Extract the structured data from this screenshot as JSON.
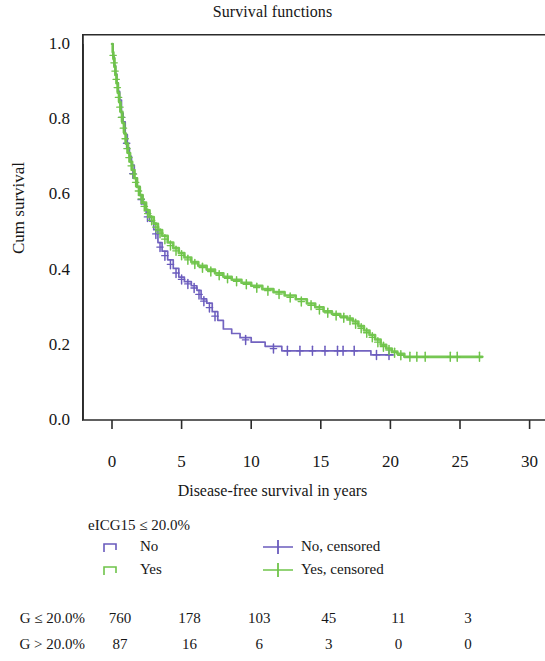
{
  "chart_data": {
    "type": "line",
    "title": "Survival functions",
    "xlabel": "Disease-free survival in years",
    "ylabel": "Cum survival",
    "xlim": [
      -1.2,
      31.5
    ],
    "ylim": [
      0.0,
      1.04
    ],
    "xticks": [
      0,
      5,
      10,
      15,
      20,
      25,
      30
    ],
    "xtick_labels": [
      "0",
      "5",
      "10",
      "15",
      "20",
      "25",
      "30"
    ],
    "yticks": [
      0.0,
      0.2,
      0.4,
      0.6,
      0.8,
      1.0
    ],
    "ytick_labels": [
      "0.0",
      "0.2",
      "0.4",
      "0.6",
      "0.8",
      "1.0"
    ],
    "grid": false,
    "legend_position": "below-axes",
    "colors": {
      "no": "#6a5bbd",
      "yes": "#6fc44a",
      "axis": "#2b2b2b",
      "text": "#161616"
    },
    "series": [
      {
        "name": "No",
        "group": "eICG15 > 20.0%",
        "color": "#6a5bbd",
        "step": "post",
        "points": [
          [
            0.0,
            1.0
          ],
          [
            0.08,
            0.966
          ],
          [
            0.16,
            0.943
          ],
          [
            0.25,
            0.92
          ],
          [
            0.35,
            0.897
          ],
          [
            0.45,
            0.874
          ],
          [
            0.55,
            0.851
          ],
          [
            0.68,
            0.816
          ],
          [
            0.8,
            0.793
          ],
          [
            0.95,
            0.759
          ],
          [
            1.1,
            0.724
          ],
          [
            1.25,
            0.701
          ],
          [
            1.4,
            0.678
          ],
          [
            1.6,
            0.644
          ],
          [
            1.8,
            0.621
          ],
          [
            2.0,
            0.598
          ],
          [
            2.2,
            0.575
          ],
          [
            2.45,
            0.552
          ],
          [
            2.7,
            0.529
          ],
          [
            3.0,
            0.506
          ],
          [
            3.3,
            0.472
          ],
          [
            3.6,
            0.449
          ],
          [
            4.0,
            0.426
          ],
          [
            4.4,
            0.403
          ],
          [
            4.8,
            0.38
          ],
          [
            5.2,
            0.368
          ],
          [
            5.7,
            0.357
          ],
          [
            6.1,
            0.345
          ],
          [
            6.4,
            0.322
          ],
          [
            6.8,
            0.311
          ],
          [
            7.2,
            0.288
          ],
          [
            7.6,
            0.265
          ],
          [
            8.0,
            0.242
          ],
          [
            8.6,
            0.23
          ],
          [
            9.2,
            0.219
          ],
          [
            10.0,
            0.207
          ],
          [
            11.0,
            0.196
          ],
          [
            12.2,
            0.184
          ],
          [
            13.0,
            0.184
          ],
          [
            14.0,
            0.184
          ],
          [
            15.0,
            0.184
          ],
          [
            16.0,
            0.184
          ],
          [
            17.0,
            0.184
          ],
          [
            17.8,
            0.184
          ],
          [
            18.6,
            0.173
          ],
          [
            19.4,
            0.173
          ],
          [
            20.2,
            0.173
          ]
        ],
        "censored": [
          [
            0.7,
            0.805
          ],
          [
            1.05,
            0.736
          ],
          [
            1.5,
            0.655
          ],
          [
            2.1,
            0.586
          ],
          [
            2.55,
            0.54
          ],
          [
            3.15,
            0.495
          ],
          [
            3.45,
            0.46
          ],
          [
            3.8,
            0.437
          ],
          [
            4.2,
            0.414
          ],
          [
            4.6,
            0.391
          ],
          [
            5.0,
            0.374
          ],
          [
            5.45,
            0.362
          ],
          [
            5.9,
            0.351
          ],
          [
            6.25,
            0.334
          ],
          [
            6.6,
            0.316
          ],
          [
            7.0,
            0.299
          ],
          [
            7.4,
            0.276
          ],
          [
            9.6,
            0.213
          ],
          [
            11.6,
            0.19
          ],
          [
            12.6,
            0.184
          ],
          [
            13.5,
            0.184
          ],
          [
            14.4,
            0.184
          ],
          [
            15.3,
            0.184
          ],
          [
            16.2,
            0.184
          ],
          [
            16.6,
            0.184
          ],
          [
            17.4,
            0.184
          ],
          [
            19.0,
            0.173
          ],
          [
            19.9,
            0.173
          ]
        ]
      },
      {
        "name": "Yes",
        "group": "eICG15 ≤ 20.0%",
        "color": "#6fc44a",
        "step": "post",
        "points": [
          [
            0.0,
            1.0
          ],
          [
            0.05,
            0.978
          ],
          [
            0.1,
            0.962
          ],
          [
            0.18,
            0.94
          ],
          [
            0.25,
            0.918
          ],
          [
            0.33,
            0.896
          ],
          [
            0.42,
            0.87
          ],
          [
            0.52,
            0.845
          ],
          [
            0.62,
            0.82
          ],
          [
            0.75,
            0.79
          ],
          [
            0.88,
            0.762
          ],
          [
            1.0,
            0.735
          ],
          [
            1.15,
            0.71
          ],
          [
            1.3,
            0.687
          ],
          [
            1.45,
            0.665
          ],
          [
            1.62,
            0.643
          ],
          [
            1.8,
            0.62
          ],
          [
            2.0,
            0.598
          ],
          [
            2.2,
            0.578
          ],
          [
            2.45,
            0.558
          ],
          [
            2.7,
            0.54
          ],
          [
            3.0,
            0.522
          ],
          [
            3.3,
            0.505
          ],
          [
            3.6,
            0.49
          ],
          [
            4.0,
            0.472
          ],
          [
            4.4,
            0.457
          ],
          [
            4.8,
            0.444
          ],
          [
            5.2,
            0.432
          ],
          [
            5.7,
            0.42
          ],
          [
            6.2,
            0.41
          ],
          [
            6.8,
            0.4
          ],
          [
            7.4,
            0.39
          ],
          [
            8.0,
            0.381
          ],
          [
            8.6,
            0.373
          ],
          [
            9.3,
            0.365
          ],
          [
            10.0,
            0.357
          ],
          [
            10.8,
            0.348
          ],
          [
            11.6,
            0.34
          ],
          [
            12.4,
            0.331
          ],
          [
            13.2,
            0.321
          ],
          [
            14.0,
            0.31
          ],
          [
            14.6,
            0.3
          ],
          [
            15.2,
            0.289
          ],
          [
            15.8,
            0.282
          ],
          [
            16.4,
            0.275
          ],
          [
            16.9,
            0.27
          ],
          [
            17.3,
            0.262
          ],
          [
            17.7,
            0.25
          ],
          [
            18.1,
            0.238
          ],
          [
            18.5,
            0.226
          ],
          [
            18.9,
            0.214
          ],
          [
            19.3,
            0.2
          ],
          [
            19.7,
            0.19
          ],
          [
            20.1,
            0.182
          ],
          [
            20.5,
            0.176
          ],
          [
            21.0,
            0.168
          ],
          [
            22.0,
            0.168
          ],
          [
            23.0,
            0.168
          ],
          [
            24.0,
            0.168
          ],
          [
            25.0,
            0.168
          ],
          [
            26.0,
            0.168
          ],
          [
            26.6,
            0.168
          ]
        ],
        "censored": [
          [
            0.08,
            0.97
          ],
          [
            0.15,
            0.95
          ],
          [
            0.22,
            0.928
          ],
          [
            0.3,
            0.906
          ],
          [
            0.38,
            0.884
          ],
          [
            0.47,
            0.858
          ],
          [
            0.57,
            0.832
          ],
          [
            0.68,
            0.805
          ],
          [
            0.82,
            0.776
          ],
          [
            0.95,
            0.748
          ],
          [
            1.08,
            0.722
          ],
          [
            1.22,
            0.698
          ],
          [
            1.38,
            0.676
          ],
          [
            1.54,
            0.654
          ],
          [
            1.7,
            0.632
          ],
          [
            1.9,
            0.609
          ],
          [
            2.1,
            0.588
          ],
          [
            2.32,
            0.568
          ],
          [
            2.57,
            0.549
          ],
          [
            2.85,
            0.531
          ],
          [
            3.15,
            0.513
          ],
          [
            3.45,
            0.497
          ],
          [
            3.8,
            0.481
          ],
          [
            4.2,
            0.464
          ],
          [
            4.6,
            0.45
          ],
          [
            5.0,
            0.438
          ],
          [
            5.45,
            0.426
          ],
          [
            5.95,
            0.415
          ],
          [
            6.5,
            0.405
          ],
          [
            7.1,
            0.395
          ],
          [
            7.7,
            0.385
          ],
          [
            8.3,
            0.377
          ],
          [
            8.95,
            0.369
          ],
          [
            9.65,
            0.361
          ],
          [
            10.4,
            0.352
          ],
          [
            11.2,
            0.344
          ],
          [
            12.0,
            0.335
          ],
          [
            12.8,
            0.326
          ],
          [
            13.6,
            0.315
          ],
          [
            14.3,
            0.305
          ],
          [
            14.9,
            0.294
          ],
          [
            15.5,
            0.285
          ],
          [
            16.1,
            0.278
          ],
          [
            16.65,
            0.272
          ],
          [
            17.1,
            0.266
          ],
          [
            17.5,
            0.256
          ],
          [
            17.9,
            0.244
          ],
          [
            18.3,
            0.232
          ],
          [
            18.7,
            0.22
          ],
          [
            19.1,
            0.207
          ],
          [
            19.5,
            0.195
          ],
          [
            19.9,
            0.186
          ],
          [
            20.3,
            0.179
          ],
          [
            20.75,
            0.172
          ],
          [
            21.4,
            0.168
          ],
          [
            21.9,
            0.168
          ],
          [
            22.5,
            0.168
          ],
          [
            24.3,
            0.168
          ],
          [
            24.8,
            0.168
          ],
          [
            26.4,
            0.168
          ]
        ]
      }
    ]
  },
  "legend": {
    "title": "eICG15 ≤ 20.0%",
    "entries": [
      {
        "label": "No",
        "marker": "step-line",
        "color": "#6a5bbd"
      },
      {
        "label": "Yes",
        "marker": "step-line",
        "color": "#6fc44a"
      },
      {
        "label": "No, censored",
        "marker": "plus-line",
        "color": "#6a5bbd"
      },
      {
        "label": "Yes, censored",
        "marker": "plus-line",
        "color": "#6fc44a"
      }
    ]
  },
  "risk_table": {
    "rows": [
      {
        "label": "eICG15 ≤ 20.0%",
        "label_clipped": "G ≤ 20.0%",
        "values": [
          "760",
          "178",
          "103",
          "45",
          "11",
          "3"
        ]
      },
      {
        "label": "eICG15 > 20.0%",
        "label_clipped": "G > 20.0%",
        "values": [
          "87",
          "16",
          "6",
          "3",
          "0",
          "0"
        ]
      }
    ]
  }
}
